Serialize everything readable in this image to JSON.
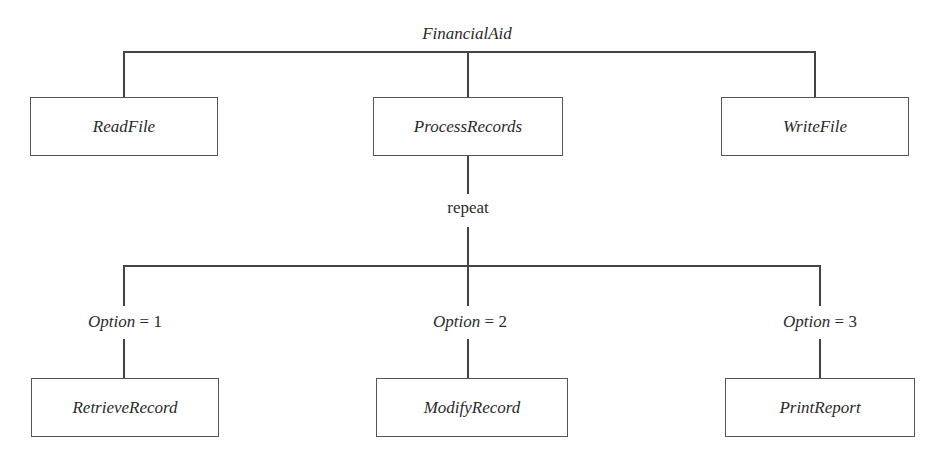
{
  "diagram": {
    "type": "structure-chart",
    "root": {
      "label": "FinancialAid"
    },
    "level1": [
      {
        "label": "ReadFile"
      },
      {
        "label": "ProcessRecords"
      },
      {
        "label": "WriteFile"
      }
    ],
    "loop_label": "repeat",
    "options": [
      {
        "var": "Option",
        "op": " = ",
        "value": "1",
        "module": "RetrieveRecord"
      },
      {
        "var": "Option",
        "op": " = ",
        "value": "2",
        "module": "ModifyRecord"
      },
      {
        "var": "Option",
        "op": " = ",
        "value": "3",
        "module": "PrintReport"
      }
    ]
  }
}
